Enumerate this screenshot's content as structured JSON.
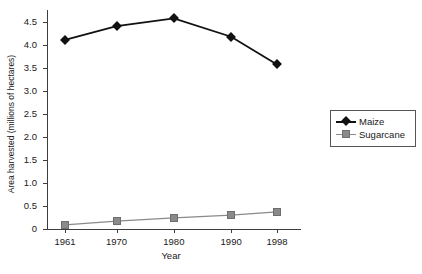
{
  "chart_data": {
    "type": "line",
    "title": "",
    "xlabel": "Year",
    "ylabel": "Area harvested (millions of hectares)",
    "categories": [
      "1961",
      "1970",
      "1980",
      "1990",
      "1998"
    ],
    "x": [
      1961,
      1970,
      1980,
      1990,
      1998
    ],
    "series": [
      {
        "name": "Maize",
        "marker": "diamond",
        "color": "#111111",
        "values": [
          4.1,
          4.4,
          4.57,
          4.17,
          3.57
        ]
      },
      {
        "name": "Sugarcane",
        "marker": "square",
        "color": "#8a8a8a",
        "values": [
          0.09,
          0.17,
          0.24,
          0.3,
          0.37
        ]
      }
    ],
    "ylim": [
      0,
      4.75
    ],
    "yticks": [
      "0",
      "0.5",
      "1.0",
      "1.5",
      "2.0",
      "2.5",
      "3.0",
      "3.5",
      "4.0",
      "4.5"
    ],
    "ytick_values": [
      0,
      0.5,
      1.0,
      1.5,
      2.0,
      2.5,
      3.0,
      3.5,
      4.0,
      4.5
    ],
    "grid": false,
    "legend_position": "right"
  }
}
